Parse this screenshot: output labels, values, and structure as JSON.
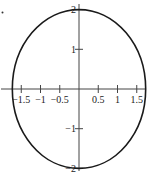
{
  "chart_data": {
    "type": "line",
    "title": "",
    "xlabel": "",
    "ylabel": "",
    "curve": "ellipse",
    "equation": "x^2/3 + y^2/4 = 1",
    "semi_axis_x": 1.732,
    "semi_axis_y": 2,
    "xlim": [
      -1.75,
      1.75
    ],
    "ylim": [
      -2.05,
      2.05
    ],
    "x_ticks": [
      -1.5,
      -1,
      -0.5,
      0.5,
      1,
      1.5
    ],
    "x_tick_labels": [
      "−1.5",
      "−1",
      "−0.5",
      "0.5",
      "1",
      "1.5"
    ],
    "y_ticks": [
      2,
      1,
      -1,
      -2
    ],
    "y_tick_labels": [
      "2",
      "1",
      "−1",
      "−2"
    ],
    "grid": false,
    "legend": "none",
    "color": "#1a1a1a"
  }
}
